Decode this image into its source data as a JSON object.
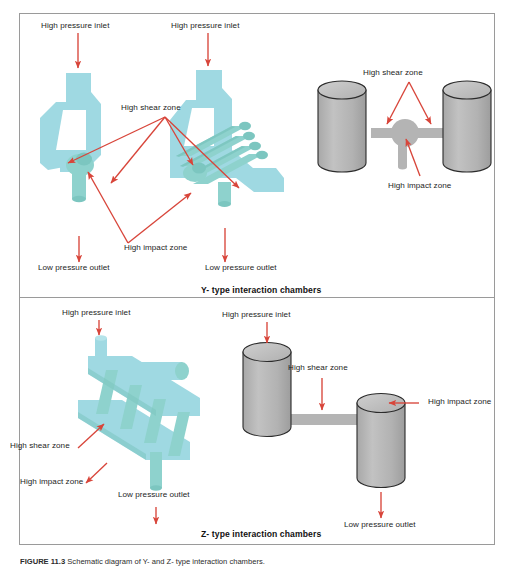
{
  "figure": {
    "caption_label": "FIGURE 11.3",
    "caption_text": "Schematic diagram of Y- and Z- type interaction chambers."
  },
  "sections": [
    {
      "id": "y-type",
      "title": "Y- type interaction chambers"
    },
    {
      "id": "z-type",
      "title": "Z- type interaction chambers"
    }
  ],
  "colors": {
    "teal_light": "#9fd9e2",
    "teal_mid": "#8fd3ce",
    "teal_dark": "#7cc6c0",
    "gray_body": "#b4b4b4",
    "gray_top": "#c3c3c3",
    "gray_outline": "#2b2b2b",
    "arrow_red": "#d8453a",
    "frame": "#9a9a9a",
    "text": "#1d1d1d"
  },
  "labels": {
    "high_pressure_inlet": "High pressure inlet",
    "high_shear_zone": "High shear zone",
    "high_impact_zone": "High impact zone",
    "low_pressure_outlet": "Low pressure outlet"
  },
  "y_section": {
    "chamber_left": {
      "inlet_label": "High pressure inlet",
      "outlet_label": "Low pressure outlet"
    },
    "chamber_middle": {
      "inlet_label": "High pressure inlet",
      "outlet_label": "Low pressure outlet"
    },
    "shared_shear_label": "High shear zone",
    "shared_impact_label": "High impact zone",
    "cylinder_model": {
      "shear_label": "High shear zone",
      "impact_label": "High impact zone"
    }
  },
  "z_section": {
    "chamber_left": {
      "inlet_label": "High pressure inlet",
      "shear_label": "High shear zone",
      "impact_label": "High impact zone",
      "outlet_label": "Low pressure outlet"
    },
    "cylinder_model": {
      "inlet_label": "High pressure inlet",
      "shear_label": "High shear zone",
      "impact_label": "High impact zone",
      "outlet_label": "Low pressure outlet"
    }
  }
}
